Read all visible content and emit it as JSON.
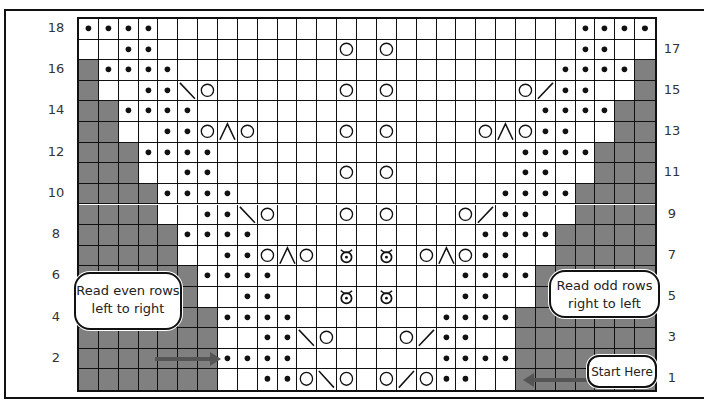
{
  "chart": {
    "columns": 29,
    "rows": 18,
    "legend_codes": {
      ".": "knit (blank square)",
      "p": "purl (dot)",
      "g": "no stitch (gray)",
      "o": "yarn over (circle)",
      "\\": "left-leaning decrease",
      "/": "right-leaning decrease",
      "^": "double decrease",
      "t": "twisted/bobble (circle with dot and horns)"
    },
    "grid_rows_top_to_bottom": [
      {
        "row": 18,
        "cells": "pppp.....................pppp"
      },
      {
        "row": 17,
        "cells": "..pp.........o.o.........pp.."
      },
      {
        "row": 16,
        "cells": "gpppp...................ppppg"
      },
      {
        "row": 15,
        "cells": "g..pp\\o......o.o......o/pp..g"
      },
      {
        "row": 14,
        "cells": "ggpppp.................ppppgg"
      },
      {
        "row": 13,
        "cells": "gg..ppo^o....o.o....o^opp..gg"
      },
      {
        "row": 12,
        "cells": "gggpppp...............ppppggg"
      },
      {
        "row": 11,
        "cells": "ggg..pp......o.o......pp..ggg"
      },
      {
        "row": 10,
        "cells": "ggggpppp.............ppppgggg"
      },
      {
        "row": 9,
        "cells": "gggg..pp\\o...o.o...o/pp..gggg"
      },
      {
        "row": 8,
        "cells": "gggggpppp...........ppppggggg"
      },
      {
        "row": 7,
        "cells": "ggggg..ppo^o.t.t.o^opp..ggggg"
      },
      {
        "row": 6,
        "cells": "ggggggpppp.........ppppgggggg"
      },
      {
        "row": 5,
        "cells": "gggggg..pp...t.t...pp..gggggg"
      },
      {
        "row": 4,
        "cells": "gggggggpppp.......ppppggggggg"
      },
      {
        "row": 3,
        "cells": "ggggggg..pp\\o...o/pp..ggggggg"
      },
      {
        "row": 2,
        "cells": "gggggggpppp.......ppppggggggg"
      },
      {
        "row": 1,
        "cells": "ggggggg..ppo\\o.o/opp..ggggggg"
      }
    ],
    "left_row_numbers": [
      "18",
      "16",
      "14",
      "12",
      "10",
      "8",
      "6",
      "4",
      "2"
    ],
    "right_row_numbers": [
      "17",
      "15",
      "13",
      "11",
      "9",
      "7",
      "5",
      "3",
      "1"
    ],
    "colors": {
      "gray": "#808080",
      "line": "#111111",
      "background": "#ffffff"
    }
  },
  "annotations": {
    "even_rows_bubble": {
      "line1": "Read even rows",
      "line2": "left to right"
    },
    "odd_rows_bubble": {
      "line1": "Read odd rows",
      "line2": "right to left"
    },
    "start_bubble": {
      "label": "Start Here"
    }
  }
}
